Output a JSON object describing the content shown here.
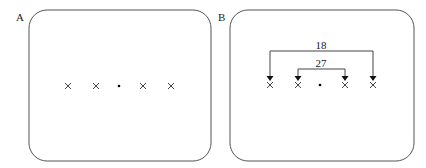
{
  "panels": [
    {
      "label": "A",
      "stimuli": [
        "x",
        "x",
        "dot",
        "x",
        "x"
      ]
    },
    {
      "label": "B",
      "stimuli": [
        "x",
        "x",
        "dot",
        "x",
        "x"
      ],
      "brackets": [
        {
          "label": "18",
          "from": 0,
          "to": 4
        },
        {
          "label": "27",
          "from": 1,
          "to": 3
        }
      ]
    }
  ]
}
